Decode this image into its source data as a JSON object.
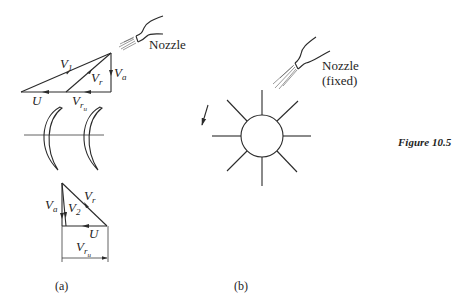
{
  "figure": {
    "label": "Figure 10.5",
    "panels": [
      {
        "id": "a",
        "caption": "(a)",
        "nozzle_label": "Nozzle",
        "inlet_triangle": {
          "labels": {
            "V1": "V",
            "V1_sub": "1",
            "Vr": "V",
            "Vr_sub": "r",
            "Va": "V",
            "Va_sub": "a",
            "U": "U",
            "Vru": "V",
            "Vru_sub": "r",
            "Vru_subsub": "u"
          }
        },
        "outlet_triangle": {
          "labels": {
            "Va": "V",
            "Va_sub": "a",
            "V2": "V",
            "V2_sub": "2",
            "Vr": "V",
            "Vr_sub": "r",
            "U": "U",
            "Vru": "V",
            "Vru_sub": "r",
            "Vru_subsub": "u"
          }
        }
      },
      {
        "id": "b",
        "caption": "(b)",
        "nozzle_label_line1": "Nozzle",
        "nozzle_label_line2": "(fixed)"
      }
    ]
  }
}
